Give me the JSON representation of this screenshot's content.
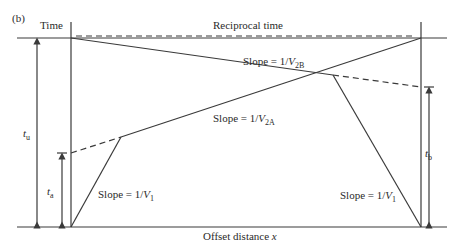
{
  "panel_label": "(b)",
  "axis_left_title": "Time",
  "axis_right_title": "Reciprocal time",
  "axis_bottom_title": "Offset distance",
  "axis_bottom_var": "x",
  "labels": {
    "tu": {
      "sym": "t",
      "sub": "u"
    },
    "ta": {
      "sym": "t",
      "sub": "a"
    },
    "tb": {
      "sym": "t",
      "sub": "b"
    },
    "slope_v2b": {
      "prefix": "Slope = 1/",
      "sym": "V",
      "sub": "2B"
    },
    "slope_v2a": {
      "prefix": "Slope = 1/",
      "sym": "V",
      "sub": "2A"
    },
    "slope_v1_left": {
      "prefix": "Slope = 1/",
      "sym": "V",
      "sub": "1"
    },
    "slope_v1_right": {
      "prefix": "Slope = 1/",
      "sym": "V",
      "sub": "1"
    }
  },
  "colors": {
    "line": "#3a3a3a",
    "background": "#ffffff"
  }
}
